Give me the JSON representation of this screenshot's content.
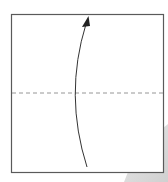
{
  "diagram": {
    "type": "origami-fold-instruction",
    "paper": {
      "x": 11,
      "y": 14,
      "width": 152,
      "height": 158,
      "fill": "#ffffff",
      "stroke": "#555555"
    },
    "fold_line": {
      "style": "valley-fold-dashed",
      "y": 93,
      "color": "#888888"
    },
    "arrow": {
      "direction": "up",
      "meaning": "fold bottom edge up to top edge",
      "color": "#333333"
    },
    "shadow": {
      "color": "#dcdcdc"
    }
  }
}
